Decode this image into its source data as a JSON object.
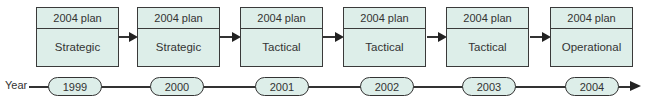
{
  "diagram": {
    "axis_label": "Year",
    "plans": [
      {
        "header": "2004 plan",
        "type": "Strategic"
      },
      {
        "header": "2004 plan",
        "type": "Strategic"
      },
      {
        "header": "2004 plan",
        "type": "Tactical"
      },
      {
        "header": "2004 plan",
        "type": "Tactical"
      },
      {
        "header": "2004 plan",
        "type": "Tactical"
      },
      {
        "header": "2004 plan",
        "type": "Operational"
      }
    ],
    "years": [
      "1999",
      "2000",
      "2001",
      "2002",
      "2003",
      "2004"
    ],
    "colors": {
      "box_fill": "#ddeee9",
      "stroke": "#3a3a3a"
    }
  }
}
